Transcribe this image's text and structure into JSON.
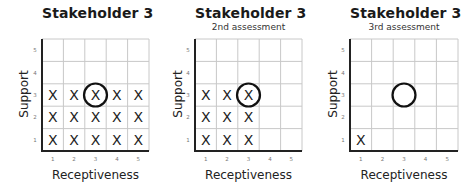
{
  "chart_data": [
    {
      "type": "heatmap",
      "title": "Stakeholder 3",
      "subtitle": "",
      "xlabel": "Receptiveness",
      "ylabel": "Support",
      "x_ticks": [
        "1",
        "2",
        "3",
        "4",
        "5"
      ],
      "y_ticks": [
        "1",
        "2",
        "3",
        "4",
        "5"
      ],
      "grid": true,
      "marks": [
        {
          "x": 1,
          "y": 1
        },
        {
          "x": 2,
          "y": 1
        },
        {
          "x": 3,
          "y": 1
        },
        {
          "x": 4,
          "y": 1
        },
        {
          "x": 5,
          "y": 1
        },
        {
          "x": 1,
          "y": 2
        },
        {
          "x": 2,
          "y": 2
        },
        {
          "x": 3,
          "y": 2
        },
        {
          "x": 4,
          "y": 2
        },
        {
          "x": 5,
          "y": 2
        },
        {
          "x": 1,
          "y": 3
        },
        {
          "x": 2,
          "y": 3
        },
        {
          "x": 3,
          "y": 3
        },
        {
          "x": 4,
          "y": 3
        },
        {
          "x": 5,
          "y": 3
        }
      ],
      "mark_symbol": "X",
      "circle": {
        "x": 3,
        "y": 3
      }
    },
    {
      "type": "heatmap",
      "title": "Stakeholder 3",
      "subtitle": "2nd assessment",
      "xlabel": "Receptiveness",
      "ylabel": "Support",
      "x_ticks": [
        "1",
        "2",
        "3",
        "4",
        "5"
      ],
      "y_ticks": [
        "1",
        "2",
        "3",
        "4",
        "5"
      ],
      "grid": true,
      "marks": [
        {
          "x": 1,
          "y": 1
        },
        {
          "x": 2,
          "y": 1
        },
        {
          "x": 3,
          "y": 1
        },
        {
          "x": 1,
          "y": 2
        },
        {
          "x": 2,
          "y": 2
        },
        {
          "x": 3,
          "y": 2
        },
        {
          "x": 1,
          "y": 3
        },
        {
          "x": 2,
          "y": 3
        },
        {
          "x": 3,
          "y": 3
        }
      ],
      "mark_symbol": "X",
      "circle": {
        "x": 3,
        "y": 3
      }
    },
    {
      "type": "heatmap",
      "title": "Stakeholder 3",
      "subtitle": "3rd assessment",
      "xlabel": "Receptiveness",
      "ylabel": "Support",
      "x_ticks": [
        "1",
        "2",
        "3",
        "4",
        "5"
      ],
      "y_ticks": [
        "1",
        "2",
        "3",
        "4",
        "5"
      ],
      "grid": true,
      "marks": [
        {
          "x": 1,
          "y": 1
        }
      ],
      "mark_symbol": "X",
      "circle": {
        "x": 3,
        "y": 3
      }
    }
  ],
  "colors": {
    "grid_line": "#c8c8c8",
    "axis_line": "#222222",
    "mark": "#222222",
    "circle": "#111111"
  }
}
